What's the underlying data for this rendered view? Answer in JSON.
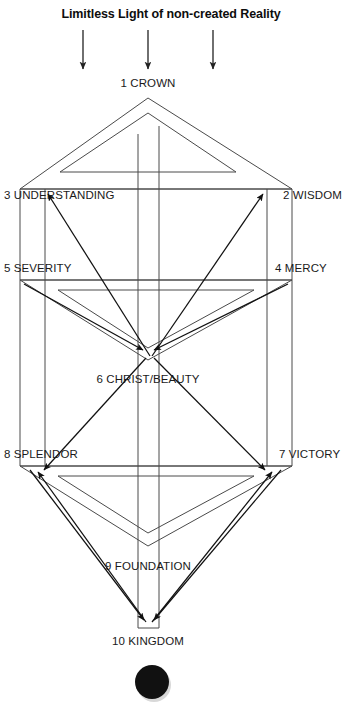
{
  "diagram": {
    "title": "Limitless Light of non-created Reality",
    "canvas": {
      "width": 343,
      "height": 705
    },
    "colors": {
      "background": "#ffffff",
      "structure_line": "#4a4a4a",
      "arrow_line": "#111111",
      "text": "#1a1a1a",
      "seal": "#111111"
    },
    "beams": {
      "count": 3,
      "label": "downward light beams",
      "x_positions": [
        83,
        148,
        213
      ],
      "y_start": 30,
      "y_end": 71
    },
    "nodes": [
      {
        "id": 1,
        "number": "1",
        "name": "CROWN",
        "label": "1 CROWN",
        "x": 148,
        "y": 87,
        "anchor": "middle"
      },
      {
        "id": 2,
        "number": "2",
        "name": "WISDOM",
        "label": "2 WISDOM",
        "x": 283,
        "y": 199,
        "anchor": "start"
      },
      {
        "id": 3,
        "number": "3",
        "name": "UNDERSTANDING",
        "label": "3 UNDERSTANDING",
        "x": 4,
        "y": 199,
        "anchor": "start"
      },
      {
        "id": 4,
        "number": "4",
        "name": "MERCY",
        "label": "4 MERCY",
        "x": 275,
        "y": 272,
        "anchor": "start"
      },
      {
        "id": 5,
        "number": "5",
        "name": "SEVERITY",
        "label": "5 SEVERITY",
        "x": 4,
        "y": 272,
        "anchor": "start"
      },
      {
        "id": 6,
        "number": "6",
        "name": "CHRIST/BEAUTY",
        "label": "6 CHRIST/BEAUTY",
        "x": 148,
        "y": 383,
        "anchor": "middle"
      },
      {
        "id": 7,
        "number": "7",
        "name": "VICTORY",
        "label": "7 VICTORY",
        "x": 279,
        "y": 458,
        "anchor": "start"
      },
      {
        "id": 8,
        "number": "8",
        "name": "SPLENDOR",
        "label": "8 SPLENDOR",
        "x": 4,
        "y": 458,
        "anchor": "start"
      },
      {
        "id": 9,
        "number": "9",
        "name": "FOUNDATION",
        "label": "9 FOUNDATION",
        "x": 148,
        "y": 570,
        "anchor": "middle"
      },
      {
        "id": 10,
        "number": "10",
        "name": "KINGDOM",
        "label": "10 KINGDOM",
        "x": 148,
        "y": 645,
        "anchor": "middle"
      }
    ],
    "seal": {
      "name": "dark-seal",
      "cx": 152,
      "cy": 682,
      "r": 17
    }
  }
}
